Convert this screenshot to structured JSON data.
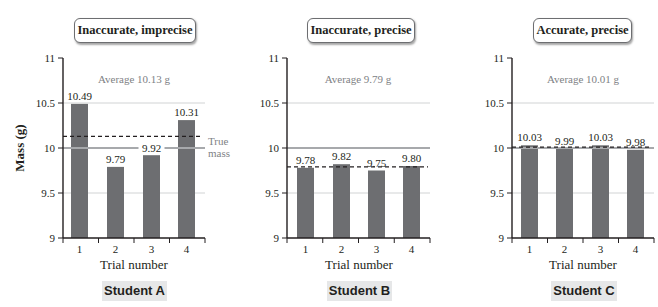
{
  "y_axis_label": "Mass (g)",
  "x_axis_label": "Trial number",
  "true_mass_label": [
    "True",
    "mass"
  ],
  "colors": {
    "bar": "#6d6e71",
    "true_line": "#a7a9ac",
    "grid": "#d1d3d4",
    "axis": "#231f20",
    "avg_text": "#808285"
  },
  "panels": [
    {
      "title": "Inaccurate, imprecise",
      "student": "Student A",
      "average_label": "Average 10.13 g"
    },
    {
      "title": "Inaccurate, precise",
      "student": "Student B",
      "average_label": "Average 9.79 g"
    },
    {
      "title": "Accurate, precise",
      "student": "Student C",
      "average_label": "Average 10.01 g"
    }
  ],
  "chart_data": [
    {
      "type": "bar",
      "title": "Inaccurate, imprecise",
      "subtitle": "Student A",
      "categories": [
        "1",
        "2",
        "3",
        "4"
      ],
      "values": [
        10.49,
        9.79,
        9.92,
        10.31
      ],
      "average": 10.13,
      "true_value": 10.0,
      "xlabel": "Trial number",
      "ylabel": "Mass (g)",
      "ylim": [
        9,
        11
      ],
      "yticks": [
        9,
        9.5,
        10,
        10.5,
        11
      ],
      "annotations": [
        "Average 10.13 g",
        "True mass"
      ]
    },
    {
      "type": "bar",
      "title": "Inaccurate, precise",
      "subtitle": "Student B",
      "categories": [
        "1",
        "2",
        "3",
        "4"
      ],
      "values": [
        9.78,
        9.82,
        9.75,
        9.8
      ],
      "average": 9.79,
      "true_value": 10.0,
      "xlabel": "Trial number",
      "ylabel": "",
      "ylim": [
        9,
        11
      ],
      "yticks": [
        9,
        9.5,
        10,
        10.5,
        11
      ],
      "annotations": [
        "Average 9.79 g"
      ]
    },
    {
      "type": "bar",
      "title": "Accurate, precise",
      "subtitle": "Student C",
      "categories": [
        "1",
        "2",
        "3",
        "4"
      ],
      "values": [
        10.03,
        9.99,
        10.03,
        9.98
      ],
      "average": 10.01,
      "true_value": 10.0,
      "xlabel": "Trial number",
      "ylabel": "",
      "ylim": [
        9,
        11
      ],
      "yticks": [
        9,
        9.5,
        10,
        10.5,
        11
      ],
      "annotations": [
        "Average 10.01 g"
      ]
    }
  ]
}
